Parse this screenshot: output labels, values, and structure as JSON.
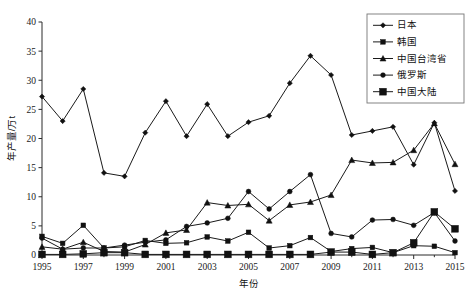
{
  "chart_data": {
    "type": "line",
    "title": "",
    "xlabel": "年份",
    "ylabel": "年产量/万t",
    "xlim": [
      1995,
      2015
    ],
    "ylim": [
      0,
      40
    ],
    "ytick_step": 5,
    "xtick_step": 2,
    "grid": false,
    "legend_position": "top-right",
    "x": [
      1995,
      1996,
      1997,
      1998,
      1999,
      2000,
      2001,
      2002,
      2003,
      2004,
      2005,
      2006,
      2007,
      2008,
      2009,
      2010,
      2011,
      2012,
      2013,
      2014,
      2015
    ],
    "xticklabels": [
      "1995",
      "1997",
      "1999",
      "2001",
      "2003",
      "2005",
      "2007",
      "2009",
      "2011",
      "2013",
      "2015"
    ],
    "yticklabels": [
      "0",
      "5",
      "10",
      "15",
      "20",
      "25",
      "30",
      "35",
      "40"
    ],
    "series": [
      {
        "name": "日本",
        "marker": "diamond",
        "values": [
          27.2,
          23.0,
          28.5,
          14.1,
          13.5,
          21.0,
          26.4,
          20.4,
          25.9,
          20.4,
          22.8,
          23.9,
          29.5,
          34.2,
          30.9,
          20.6,
          21.3,
          22.0,
          15.5,
          22.7,
          11.0
        ]
      },
      {
        "name": "韩国",
        "marker": "square-small",
        "values": [
          3.2,
          2.0,
          5.1,
          1.2,
          1.4,
          2.5,
          2.0,
          2.1,
          3.1,
          2.4,
          3.9,
          1.2,
          1.6,
          3.0,
          0.6,
          1.1,
          1.3,
          0.4,
          1.6,
          1.5,
          0.4
        ]
      },
      {
        "name": "中国台湾省",
        "marker": "triangle",
        "values": [
          1.4,
          1.0,
          2.2,
          0.6,
          0.5,
          1.8,
          3.8,
          4.3,
          9.0,
          8.5,
          8.7,
          5.9,
          8.6,
          9.1,
          10.3,
          16.3,
          15.8,
          15.9,
          18.0,
          22.6,
          15.6
        ]
      },
      {
        "name": "俄罗斯",
        "marker": "circle",
        "values": [
          2.9,
          1.0,
          1.2,
          1.2,
          1.7,
          2.2,
          2.6,
          4.9,
          5.5,
          6.3,
          10.9,
          7.9,
          10.9,
          13.8,
          3.7,
          3.1,
          6.0,
          6.1,
          5.1,
          7.3,
          2.4
        ]
      },
      {
        "name": "中国大陆",
        "marker": "square-large",
        "values": [
          0.1,
          0.1,
          0.2,
          0.4,
          0.4,
          0.1,
          0.1,
          0.1,
          0.1,
          0.1,
          0.1,
          0.1,
          0.1,
          0.1,
          0.5,
          0.5,
          0.1,
          0.4,
          2.1,
          7.4,
          4.5
        ]
      }
    ]
  },
  "legend": {
    "items": [
      {
        "label": "日本"
      },
      {
        "label": "韩国"
      },
      {
        "label": "中国台湾省"
      },
      {
        "label": "俄罗斯"
      },
      {
        "label": "中国大陆"
      }
    ]
  }
}
